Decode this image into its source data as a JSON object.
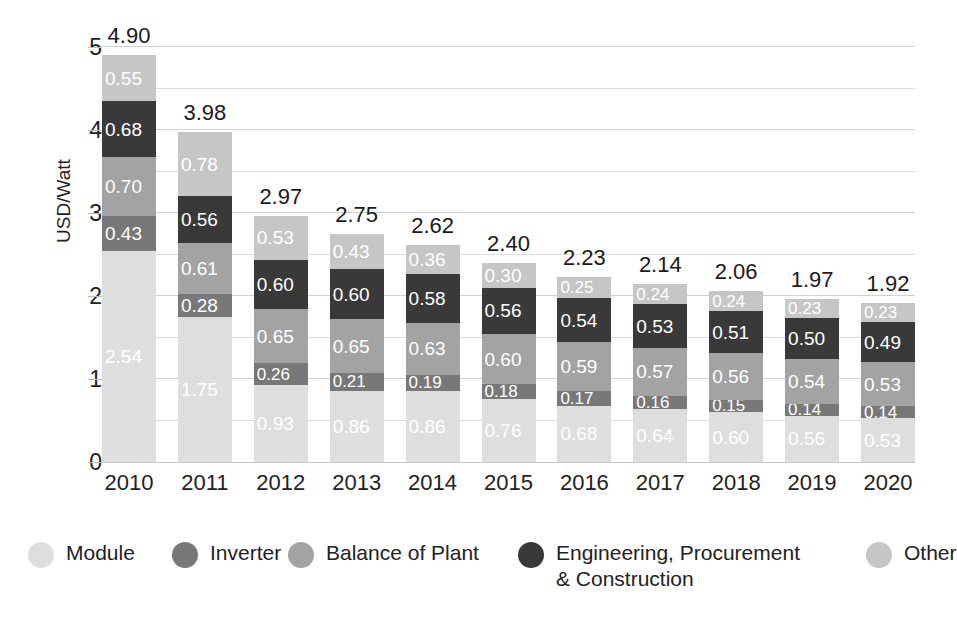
{
  "chart_data": {
    "type": "bar",
    "subtype": "stacked-bar",
    "title": "",
    "xlabel": "",
    "ylabel": "USD/Watt",
    "ylim": [
      0,
      5
    ],
    "ytick_labels": [
      "0",
      "1",
      "2",
      "3",
      "4",
      "5"
    ],
    "ytick_values": [
      0,
      1,
      2,
      3,
      4,
      5
    ],
    "minor_gridlines": [
      0.5,
      1.5,
      2.5,
      3.5,
      4.5
    ],
    "grid": true,
    "legend_position": "bottom",
    "categories": [
      "2010",
      "2011",
      "2012",
      "2013",
      "2014",
      "2015",
      "2016",
      "2017",
      "2018",
      "2019",
      "2020"
    ],
    "series": [
      {
        "name": "Module",
        "color": "#dedede",
        "values": [
          2.54,
          1.75,
          0.93,
          0.86,
          0.86,
          0.76,
          0.68,
          0.64,
          0.6,
          0.56,
          0.53
        ]
      },
      {
        "name": "Inverter",
        "color": "#787878",
        "values": [
          0.43,
          0.28,
          0.26,
          0.21,
          0.19,
          0.18,
          0.17,
          0.16,
          0.15,
          0.14,
          0.14
        ]
      },
      {
        "name": "Balance of Plant",
        "color": "#a3a3a3",
        "values": [
          0.7,
          0.61,
          0.65,
          0.65,
          0.63,
          0.6,
          0.59,
          0.57,
          0.56,
          0.54,
          0.53
        ]
      },
      {
        "name": "Engineering, Procurement & Construction",
        "color": "#393939",
        "values": [
          0.68,
          0.56,
          0.6,
          0.6,
          0.58,
          0.56,
          0.54,
          0.53,
          0.51,
          0.5,
          0.49
        ]
      },
      {
        "name": "Other",
        "color": "#c6c6c6",
        "values": [
          0.55,
          0.78,
          0.53,
          0.43,
          0.36,
          0.3,
          0.25,
          0.24,
          0.24,
          0.23,
          0.23
        ]
      }
    ],
    "totals": [
      "4.90",
      "3.98",
      "2.97",
      "2.75",
      "2.62",
      "2.40",
      "2.23",
      "2.14",
      "2.06",
      "1.97",
      "1.92"
    ],
    "value_label_format": "0.00"
  },
  "legend": {
    "items": [
      {
        "label": "Module",
        "color": "#dedede"
      },
      {
        "label": "Inverter",
        "color": "#787878"
      },
      {
        "label": "Balance of Plant",
        "color": "#a3a3a3"
      },
      {
        "label": "Engineering, Procurement\n& Construction",
        "color": "#393939"
      },
      {
        "label": "Other",
        "color": "#c6c6c6"
      }
    ]
  }
}
